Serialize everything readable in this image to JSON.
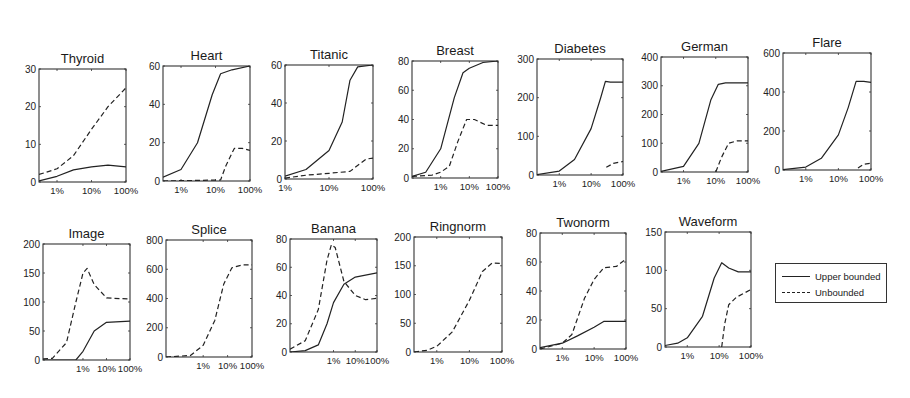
{
  "chart_data": [
    {
      "type": "line",
      "title": "Thyroid",
      "box": [
        39,
        69,
        126,
        182
      ],
      "xmin": 0.3,
      "ylim": [
        0,
        30
      ],
      "yticks": [
        0,
        10,
        20,
        30
      ],
      "xticks": [
        "1%",
        "10%",
        "100%"
      ],
      "xlabel": "",
      "ylabel": "",
      "series": [
        {
          "name": "Upper bounded",
          "style": "solid",
          "points": [
            [
              0.3,
              0.3
            ],
            [
              1,
              1.5
            ],
            [
              3,
              3.2
            ],
            [
              10,
              4
            ],
            [
              30,
              4.5
            ],
            [
              100,
              4
            ]
          ]
        },
        {
          "name": "Unbounded",
          "style": "dashed",
          "points": [
            [
              0.3,
              2
            ],
            [
              1,
              3.5
            ],
            [
              3,
              7
            ],
            [
              10,
              14
            ],
            [
              30,
              20
            ],
            [
              100,
              25
            ]
          ]
        }
      ]
    },
    {
      "type": "line",
      "title": "Heart",
      "box": [
        163,
        66,
        250,
        181
      ],
      "xmin": 0.3,
      "ylim": [
        0,
        60
      ],
      "yticks": [
        0,
        20,
        40,
        60
      ],
      "xticks": [
        "1%",
        "10%",
        "100%"
      ],
      "xlabel": "",
      "ylabel": "",
      "series": [
        {
          "name": "Upper bounded",
          "style": "solid",
          "points": [
            [
              0.3,
              2
            ],
            [
              1,
              6
            ],
            [
              3,
              20
            ],
            [
              8,
              45
            ],
            [
              14,
              56
            ],
            [
              30,
              58
            ],
            [
              100,
              60
            ]
          ]
        },
        {
          "name": "Unbounded",
          "style": "dashed",
          "points": [
            [
              0.3,
              0
            ],
            [
              14,
              0.5
            ],
            [
              20,
              8
            ],
            [
              35,
              17
            ],
            [
              60,
              17
            ],
            [
              100,
              16
            ]
          ]
        }
      ]
    },
    {
      "type": "line",
      "title": "Titanic",
      "box": [
        285,
        65,
        373,
        179
      ],
      "xmin": 1,
      "ylim": [
        0,
        60
      ],
      "yticks": [
        0,
        20,
        40,
        60
      ],
      "xticks": [
        "1%",
        "10%",
        "100%"
      ],
      "xlabel": "",
      "ylabel": "",
      "series": [
        {
          "name": "Upper bounded",
          "style": "solid",
          "points": [
            [
              1,
              1.5
            ],
            [
              3,
              5
            ],
            [
              10,
              15
            ],
            [
              20,
              30
            ],
            [
              30,
              52
            ],
            [
              45,
              59
            ],
            [
              100,
              60
            ]
          ]
        },
        {
          "name": "Unbounded",
          "style": "dashed",
          "points": [
            [
              1,
              0.5
            ],
            [
              3,
              2
            ],
            [
              10,
              3
            ],
            [
              30,
              4
            ],
            [
              50,
              8
            ],
            [
              70,
              10.5
            ],
            [
              100,
              11
            ]
          ]
        }
      ]
    },
    {
      "type": "line",
      "title": "Breast",
      "box": [
        412,
        61,
        498,
        178
      ],
      "xmin": 0.1,
      "ylim": [
        0,
        80
      ],
      "yticks": [
        0,
        20,
        40,
        60,
        80
      ],
      "xticks": [
        "1%",
        "10%",
        "100%"
      ],
      "xlabel": "",
      "ylabel": "",
      "series": [
        {
          "name": "Upper bounded",
          "style": "solid",
          "points": [
            [
              0.1,
              1
            ],
            [
              0.3,
              4
            ],
            [
              1,
              20
            ],
            [
              3,
              55
            ],
            [
              6,
              72
            ],
            [
              10,
              75
            ],
            [
              30,
              79
            ],
            [
              100,
              80
            ]
          ]
        },
        {
          "name": "Unbounded",
          "style": "dashed",
          "points": [
            [
              0.1,
              1
            ],
            [
              0.5,
              2
            ],
            [
              1,
              4
            ],
            [
              2,
              8
            ],
            [
              4,
              25
            ],
            [
              8,
              40
            ],
            [
              15,
              40
            ],
            [
              40,
              36
            ],
            [
              100,
              36
            ]
          ]
        }
      ]
    },
    {
      "type": "line",
      "title": "Diabetes",
      "box": [
        537,
        59,
        623,
        175
      ],
      "xmin": 0.2,
      "ylim": [
        0,
        300
      ],
      "yticks": [
        0,
        100,
        200,
        300
      ],
      "xticks": [
        "1%",
        "10%",
        "100%"
      ],
      "xlabel": "",
      "ylabel": "",
      "series": [
        {
          "name": "Upper bounded",
          "style": "solid",
          "points": [
            [
              0.2,
              1
            ],
            [
              1,
              10
            ],
            [
              3,
              40
            ],
            [
              10,
              120
            ],
            [
              20,
              200
            ],
            [
              28,
              242
            ],
            [
              40,
              240
            ],
            [
              100,
              240
            ]
          ]
        },
        {
          "name": "Unbounded",
          "style": "dashed",
          "points": [
            [
              30,
              20
            ],
            [
              50,
              30
            ],
            [
              100,
              35
            ]
          ]
        }
      ]
    },
    {
      "type": "line",
      "title": "German",
      "box": [
        661,
        57,
        748,
        172
      ],
      "xmin": 0.2,
      "ylim": [
        0,
        400
      ],
      "yticks": [
        0,
        100,
        200,
        300,
        400
      ],
      "xticks": [
        "1%",
        "10%",
        "100%"
      ],
      "xlabel": "",
      "ylabel": "",
      "series": [
        {
          "name": "Upper bounded",
          "style": "solid",
          "points": [
            [
              0.2,
              2
            ],
            [
              1,
              20
            ],
            [
              3,
              100
            ],
            [
              7,
              250
            ],
            [
              12,
              305
            ],
            [
              20,
              310
            ],
            [
              100,
              310
            ]
          ]
        },
        {
          "name": "Unbounded",
          "style": "dashed",
          "points": [
            [
              10,
              0
            ],
            [
              15,
              50
            ],
            [
              25,
              100
            ],
            [
              45,
              108
            ],
            [
              100,
              108
            ]
          ]
        }
      ]
    },
    {
      "type": "line",
      "title": "Flare",
      "box": [
        783,
        53,
        871,
        170
      ],
      "xmin": 0.2,
      "ylim": [
        0,
        600
      ],
      "yticks": [
        0,
        200,
        400,
        600
      ],
      "xticks": [
        "1%",
        "10%",
        "100%"
      ],
      "xlabel": "",
      "ylabel": "",
      "series": [
        {
          "name": "Upper bounded",
          "style": "solid",
          "points": [
            [
              0.2,
              2
            ],
            [
              1,
              15
            ],
            [
              3,
              60
            ],
            [
              10,
              180
            ],
            [
              20,
              320
            ],
            [
              35,
              455
            ],
            [
              60,
              455
            ],
            [
              100,
              450
            ]
          ]
        },
        {
          "name": "Unbounded",
          "style": "dashed",
          "points": [
            [
              40,
              10
            ],
            [
              60,
              30
            ],
            [
              100,
              35
            ]
          ]
        }
      ]
    },
    {
      "type": "line",
      "title": "Image",
      "box": [
        43,
        244,
        130,
        360
      ],
      "xmin": 0.02,
      "ylim": [
        0,
        200
      ],
      "yticks": [
        0,
        50,
        100,
        150,
        200
      ],
      "xticks": [
        "1%",
        "10%",
        "100%"
      ],
      "xlabel": "",
      "ylabel": "",
      "series": [
        {
          "name": "Upper bounded",
          "style": "solid",
          "points": [
            [
              0.02,
              0
            ],
            [
              0.5,
              0
            ],
            [
              1,
              15
            ],
            [
              3,
              50
            ],
            [
              10,
              65
            ],
            [
              100,
              67
            ]
          ]
        },
        {
          "name": "Unbounded",
          "style": "dashed",
          "points": [
            [
              0.02,
              2
            ],
            [
              0.05,
              3
            ],
            [
              0.2,
              30
            ],
            [
              0.5,
              100
            ],
            [
              1,
              150
            ],
            [
              1.5,
              158
            ],
            [
              3,
              130
            ],
            [
              10,
              107
            ],
            [
              100,
              105
            ]
          ]
        }
      ]
    },
    {
      "type": "line",
      "title": "Splice",
      "box": [
        166,
        240,
        252,
        357
      ],
      "xmin": 0.03,
      "ylim": [
        0,
        800
      ],
      "yticks": [
        0,
        200,
        400,
        600,
        800
      ],
      "xticks": [
        "1%",
        "10%",
        "100%"
      ],
      "xlabel": "",
      "ylabel": "",
      "series": [
        {
          "name": "Unbounded",
          "style": "dashed",
          "points": [
            [
              0.03,
              0
            ],
            [
              0.3,
              10
            ],
            [
              1,
              80
            ],
            [
              3,
              250
            ],
            [
              7,
              500
            ],
            [
              15,
              610
            ],
            [
              40,
              630
            ],
            [
              100,
              630
            ]
          ]
        }
      ]
    },
    {
      "type": "line",
      "title": "Banana",
      "box": [
        290,
        239,
        377,
        352
      ],
      "xmin": 0.01,
      "ylim": [
        0,
        80
      ],
      "yticks": [
        0,
        20,
        40,
        60,
        80
      ],
      "xticks": [
        "1%",
        "10%",
        "100%"
      ],
      "xlabel": "",
      "ylabel": "",
      "series": [
        {
          "name": "Upper bounded",
          "style": "solid",
          "points": [
            [
              0.01,
              0
            ],
            [
              0.05,
              1
            ],
            [
              0.2,
              5
            ],
            [
              0.5,
              20
            ],
            [
              1,
              35
            ],
            [
              3,
              48
            ],
            [
              10,
              53
            ],
            [
              100,
              56
            ]
          ]
        },
        {
          "name": "Unbounded",
          "style": "dashed",
          "points": [
            [
              0.01,
              2
            ],
            [
              0.05,
              8
            ],
            [
              0.2,
              30
            ],
            [
              0.5,
              65
            ],
            [
              0.8,
              76
            ],
            [
              1.2,
              74
            ],
            [
              3,
              50
            ],
            [
              10,
              40
            ],
            [
              30,
              37
            ],
            [
              100,
              38
            ]
          ]
        }
      ]
    },
    {
      "type": "line",
      "title": "Ringnorm",
      "box": [
        414,
        237,
        502,
        352
      ],
      "xmin": 0.2,
      "ylim": [
        0,
        200
      ],
      "yticks": [
        0,
        50,
        100,
        150,
        200
      ],
      "xticks": [
        "1%",
        "10%",
        "100%"
      ],
      "xlabel": "",
      "ylabel": "",
      "series": [
        {
          "name": "Unbounded",
          "style": "dashed",
          "points": [
            [
              0.2,
              0
            ],
            [
              0.5,
              3
            ],
            [
              1,
              10
            ],
            [
              3,
              35
            ],
            [
              10,
              90
            ],
            [
              25,
              140
            ],
            [
              50,
              155
            ],
            [
              100,
              154
            ]
          ]
        }
      ]
    },
    {
      "type": "line",
      "title": "Twonorm",
      "box": [
        540,
        233,
        626,
        349
      ],
      "xmin": 0.2,
      "ylim": [
        0,
        80
      ],
      "yticks": [
        0,
        20,
        40,
        60,
        80
      ],
      "xticks": [
        "1%",
        "10%",
        "100%"
      ],
      "xlabel": "",
      "ylabel": "",
      "series": [
        {
          "name": "Upper bounded",
          "style": "solid",
          "points": [
            [
              0.2,
              1
            ],
            [
              1,
              4
            ],
            [
              3,
              9
            ],
            [
              10,
              15
            ],
            [
              20,
              19
            ],
            [
              100,
              19
            ]
          ]
        },
        {
          "name": "Unbounded",
          "style": "dashed",
          "points": [
            [
              0.2,
              0
            ],
            [
              1,
              4
            ],
            [
              2,
              10
            ],
            [
              5,
              35
            ],
            [
              10,
              48
            ],
            [
              20,
              56
            ],
            [
              50,
              57
            ],
            [
              100,
              62
            ]
          ]
        }
      ]
    },
    {
      "type": "line",
      "title": "Waveform",
      "box": [
        665,
        232,
        751,
        347
      ],
      "xmin": 0.2,
      "ylim": [
        0,
        150
      ],
      "yticks": [
        0,
        50,
        100,
        150
      ],
      "xticks": [
        "1%",
        "10%",
        "100%"
      ],
      "xlabel": "",
      "ylabel": "",
      "series": [
        {
          "name": "Upper bounded",
          "style": "solid",
          "points": [
            [
              0.2,
              2
            ],
            [
              0.5,
              5
            ],
            [
              1,
              12
            ],
            [
              3,
              40
            ],
            [
              7,
              90
            ],
            [
              12,
              110
            ],
            [
              20,
              103
            ],
            [
              40,
              98
            ],
            [
              100,
              98
            ]
          ]
        },
        {
          "name": "Unbounded",
          "style": "dashed",
          "points": [
            [
              12,
              0
            ],
            [
              15,
              30
            ],
            [
              20,
              55
            ],
            [
              35,
              65
            ],
            [
              100,
              75
            ]
          ]
        }
      ]
    }
  ],
  "legend": {
    "entries": [
      {
        "label": "Upper bounded",
        "style": "solid"
      },
      {
        "label": "Unbounded",
        "style": "dashed"
      }
    ]
  }
}
